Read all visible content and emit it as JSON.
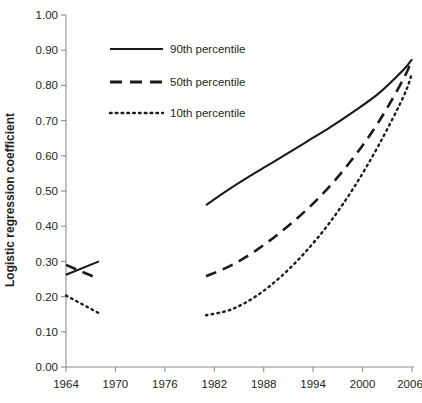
{
  "chart_data": {
    "type": "line",
    "title": "",
    "xlabel": "",
    "ylabel": "Logistic regression coefficient",
    "xlim": [
      1962,
      2008
    ],
    "ylim": [
      0.0,
      1.0
    ],
    "grid": false,
    "legend_position": "top-left-inside",
    "x_ticks": [
      "1964",
      "1970",
      "1976",
      "1982",
      "1988",
      "1994",
      "2000",
      "2006"
    ],
    "x_tick_values": [
      1964,
      1970,
      1976,
      1982,
      1988,
      1994,
      2000,
      2006
    ],
    "y_ticks": [
      "0.00",
      "0.10",
      "0.20",
      "0.30",
      "0.40",
      "0.50",
      "0.60",
      "0.70",
      "0.80",
      "0.90",
      "1.00"
    ],
    "y_tick_values": [
      0.0,
      0.1,
      0.2,
      0.3,
      0.4,
      0.5,
      0.6,
      0.7,
      0.8,
      0.9,
      1.0
    ],
    "series": [
      {
        "name": "90th percentile",
        "style": "solid",
        "color": "#1a1a1a",
        "segments": [
          {
            "label": "early",
            "x": [
              1964,
              1968
            ],
            "values": [
              0.262,
              0.3
            ]
          },
          {
            "label": "late",
            "x": [
              1981,
              1984,
              1987,
              1990,
              1993,
              1996,
              1999,
              2002,
              2005,
              2006
            ],
            "values": [
              0.46,
              0.508,
              0.552,
              0.594,
              0.637,
              0.68,
              0.727,
              0.778,
              0.845,
              0.874
            ]
          }
        ]
      },
      {
        "name": "50th percentile",
        "style": "dashed",
        "color": "#1a1a1a",
        "segments": [
          {
            "label": "early",
            "x": [
              1964,
              1968
            ],
            "values": [
              0.29,
              0.25
            ]
          },
          {
            "label": "late",
            "x": [
              1981,
              1984,
              1987,
              1990,
              1993,
              1996,
              1999,
              2002,
              2005,
              2006
            ],
            "values": [
              0.258,
              0.288,
              0.33,
              0.382,
              0.442,
              0.513,
              0.598,
              0.698,
              0.82,
              0.874
            ]
          }
        ]
      },
      {
        "name": "10th percentile",
        "style": "dotted",
        "color": "#1a1a1a",
        "segments": [
          {
            "label": "early",
            "x": [
              1964,
              1968
            ],
            "values": [
              0.203,
              0.153
            ]
          },
          {
            "label": "late",
            "x": [
              1981,
              1984,
              1987,
              1990,
              1993,
              1996,
              1999,
              2002,
              2005,
              2006
            ],
            "values": [
              0.147,
              0.163,
              0.2,
              0.255,
              0.325,
              0.41,
              0.512,
              0.632,
              0.77,
              0.835
            ]
          }
        ]
      }
    ]
  },
  "legend": {
    "items": [
      {
        "label": "90th percentile",
        "style": "solid"
      },
      {
        "label": "50th percentile",
        "style": "dashed"
      },
      {
        "label": "10th percentile",
        "style": "dotted"
      }
    ]
  },
  "axes": {
    "y_title": "Logistic regression coefficient"
  }
}
